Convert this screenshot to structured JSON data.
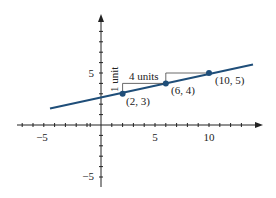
{
  "diagram": {
    "title": "",
    "line_color": "#1f4e79",
    "point_color": "#1f4e79",
    "axis_color": "#222222",
    "x_axis": {
      "ticks_labeled": [
        -5,
        5,
        10
      ],
      "labels": {
        "neg5": "−5",
        "pos5": "5",
        "pos10": "10"
      }
    },
    "y_axis": {
      "ticks_labeled": [
        5,
        -5
      ],
      "labels": {
        "pos5": "5",
        "neg5": "−5"
      }
    },
    "points": [
      {
        "x": 2,
        "y": 3,
        "label": "(2, 3)"
      },
      {
        "x": 6,
        "y": 4,
        "label": "(6, 4)"
      },
      {
        "x": 10,
        "y": 5,
        "label": "(10, 5)"
      }
    ],
    "annotations": {
      "run": "4 units",
      "rise": "1 unit"
    }
  }
}
